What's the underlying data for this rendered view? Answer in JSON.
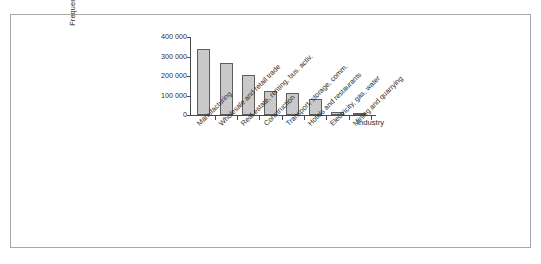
{
  "figure": {
    "border_color": "#a8a8a8",
    "background": "#ffffff"
  },
  "axis": {
    "x_title": "Industry",
    "y_title": "Frequency (x100)"
  },
  "chart_data": {
    "type": "bar",
    "title": "",
    "xlabel": "Industry",
    "ylabel": "Frequency (x100)",
    "ylim": [
      0,
      400000
    ],
    "yticks": [
      0,
      100000,
      200000,
      300000,
      400000
    ],
    "ytick_labels": [
      "0",
      "100 000",
      "200 000",
      "300 000",
      "400 000"
    ],
    "grid": false,
    "legend": false,
    "bar_fill_color": "#c9c9c9",
    "bar_edge_color": "#5d5d5d",
    "categories": [
      "Manufacturing",
      "Wholesale and retail trade",
      "Real estate, renting, bus. activ.",
      "Construction",
      "Transport, storage, comm.",
      "Hotels and restaurants",
      "Electricity, gas, water",
      "Mining and quarrying"
    ],
    "values": [
      340000,
      265000,
      203000,
      124000,
      111000,
      80000,
      18000,
      12000
    ]
  }
}
